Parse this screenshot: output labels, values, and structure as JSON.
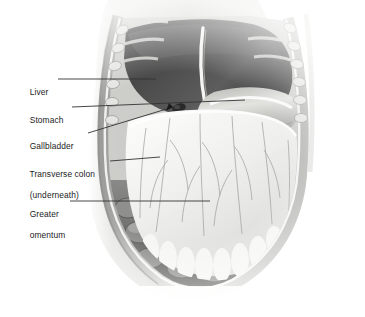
{
  "figure": {
    "type": "anatomical-illustration",
    "style": "grayscale halftone medical drawing",
    "background_color": "#ffffff"
  },
  "labels": [
    {
      "id": "liver",
      "text": "Liver",
      "text2": "",
      "x": 20,
      "y": 76,
      "leader": {
        "x1": 58,
        "y1": 79,
        "x2": 156,
        "y2": 79
      }
    },
    {
      "id": "stomach",
      "text": "Stomach",
      "text2": "",
      "x": 20,
      "y": 104,
      "leader": {
        "x1": 72,
        "y1": 107,
        "x2": 245,
        "y2": 100
      }
    },
    {
      "id": "gallbladder",
      "text": "Gallbladder",
      "text2": "",
      "x": 20,
      "y": 130,
      "leader": {
        "x1": 88,
        "y1": 133,
        "x2": 173,
        "y2": 107
      }
    },
    {
      "id": "transverse-colon",
      "text": "Transverse colon",
      "text2": "(underneath)",
      "x": 20,
      "y": 158,
      "leader": {
        "x1": 110,
        "y1": 161,
        "x2": 160,
        "y2": 157
      }
    },
    {
      "id": "greater-omentum",
      "text": "Greater",
      "text2": "omentum",
      "x": 20,
      "y": 198,
      "leader": {
        "x1": 70,
        "y1": 201,
        "x2": 210,
        "y2": 201
      }
    }
  ],
  "structures": [
    {
      "id": "liver",
      "name": "Liver",
      "tone": "dark-gray"
    },
    {
      "id": "falciform",
      "name": "Falciform ligament",
      "tone": "bright-highlight"
    },
    {
      "id": "stomach",
      "name": "Stomach greater curvature",
      "tone": "light-gray"
    },
    {
      "id": "gallbladder",
      "name": "Gallbladder fundus",
      "tone": "dark-spot"
    },
    {
      "id": "greater-omentum",
      "name": "Greater omentum apron",
      "tone": "pale-white"
    },
    {
      "id": "omental-vessels",
      "name": "Omental blood vessels",
      "tone": "mid-gray-lines"
    },
    {
      "id": "small-intestine",
      "name": "Small intestine loops",
      "tone": "mid-dark-gray"
    },
    {
      "id": "rib-cage-left",
      "name": "Cut ribs and costal cartilage (left flank)",
      "tone": "light-gray"
    },
    {
      "id": "rib-cage-right",
      "name": "Cut ribs and costal cartilage (right flank)",
      "tone": "light-gray"
    },
    {
      "id": "abdominal-wall",
      "name": "Cut abdominal wall edge",
      "tone": "light-gray"
    },
    {
      "id": "torso-body",
      "name": "Torso body surface",
      "tone": "pale-gray"
    }
  ],
  "colors": {
    "ink": "#1b1b1b",
    "leader_line": "#333333",
    "liver_dark": "#4a4a4a",
    "omentum_pale": "#f2f2f0",
    "bowel_mid": "#7c7c7c",
    "wall_light": "#cfcfcf",
    "background": "#ffffff"
  }
}
